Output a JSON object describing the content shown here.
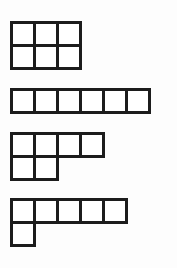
{
  "page": {
    "background_color": "#fdfdfd",
    "stroke_color": "#1c1c1c",
    "cell_fill_color": "#ffffff",
    "cell_size_px": 26,
    "stroke_width_px": 3,
    "figure_count": 4
  },
  "figures": [
    {
      "index": 1,
      "name": "rectangle-3x2",
      "label": "3 by 2 rectangle",
      "cell_count": 6,
      "rows": [
        3,
        3
      ],
      "row_offsets": [
        0,
        0
      ],
      "width_cells": 3,
      "height_cells": 2,
      "top_px": 21,
      "left_px": 10
    },
    {
      "index": 2,
      "name": "strip-6x1",
      "label": "6 by 1 horizontal strip",
      "cell_count": 6,
      "rows": [
        6
      ],
      "row_offsets": [
        0
      ],
      "width_cells": 6,
      "height_cells": 1,
      "top_px": 88,
      "left_px": 10
    },
    {
      "index": 3,
      "name": "p-shape-4-2",
      "label": "P shape: top row 4 cells, bottom row 2 cells",
      "cell_count": 6,
      "rows": [
        4,
        2
      ],
      "row_offsets": [
        0,
        0
      ],
      "width_cells": 4,
      "height_cells": 2,
      "top_px": 132,
      "left_px": 10
    },
    {
      "index": 4,
      "name": "l-shape-5-1",
      "label": "L shape: top row 5 cells, bottom row 1 cell",
      "cell_count": 6,
      "rows": [
        5,
        1
      ],
      "row_offsets": [
        0,
        0
      ],
      "width_cells": 5,
      "height_cells": 2,
      "top_px": 198,
      "left_px": 10
    }
  ]
}
